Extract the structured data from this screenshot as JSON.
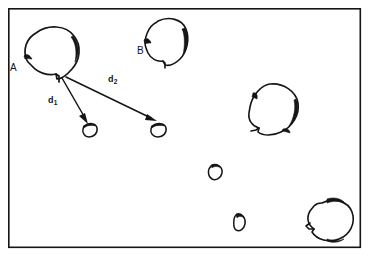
{
  "figure": {
    "background_color": "#ffffff",
    "ink_color": "#151515",
    "frame": {
      "x": 8,
      "y": 8,
      "width": 353,
      "height": 240,
      "stroke_width": 1.6
    },
    "point_labels": [
      {
        "id": "label-a",
        "text": "A",
        "x": 10,
        "y": 63
      },
      {
        "id": "label-b",
        "text": "B",
        "x": 137,
        "y": 46
      }
    ],
    "vector_labels": [
      {
        "id": "label-d1",
        "base": "d",
        "sub": "1",
        "x": 48,
        "y": 96
      },
      {
        "id": "label-d2",
        "base": "d",
        "sub": "2",
        "x": 108,
        "y": 75
      }
    ],
    "vectors": [
      {
        "id": "vector-d1",
        "name": "d1",
        "from_x": 62,
        "from_y": 78,
        "to_x": 88,
        "to_y": 122
      },
      {
        "id": "vector-d2",
        "name": "d2",
        "from_x": 66,
        "from_y": 76,
        "to_x": 155,
        "to_y": 120
      }
    ],
    "shapes": [
      {
        "id": "shape-a",
        "name": "outline-large-a",
        "size": "large"
      },
      {
        "id": "shape-b",
        "name": "outline-medium-b",
        "size": "medium"
      },
      {
        "id": "shape-right-mid",
        "name": "outline-medium-right",
        "size": "medium"
      },
      {
        "id": "shape-bottom-right",
        "name": "outline-medium-bottom-right",
        "size": "medium"
      },
      {
        "id": "shape-small-d1",
        "name": "outline-small-d1-target",
        "size": "small"
      },
      {
        "id": "shape-small-d2",
        "name": "outline-small-d2-target",
        "size": "small"
      },
      {
        "id": "shape-small-center",
        "name": "outline-small-center",
        "size": "small"
      },
      {
        "id": "shape-small-lower",
        "name": "outline-small-lower",
        "size": "small"
      }
    ]
  }
}
